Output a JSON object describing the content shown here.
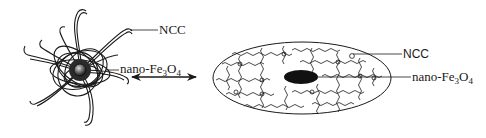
{
  "diagram": {
    "left_structure": {
      "name": "NCC-coated nanoparticle (star/flower form)",
      "labels": {
        "ncc": "NCC",
        "core_prefix": "nano-Fe",
        "core_sub1": "3",
        "core_mid": "O",
        "core_sub2": "4"
      }
    },
    "arrow": {
      "type": "double-headed",
      "meaning": "reversible transformation"
    },
    "right_structure": {
      "name": "NCC network (ellipsoid form) with magnetic core",
      "labels": {
        "ncc": "NCC",
        "core_prefix": "nano-Fe",
        "core_sub1": "3",
        "core_mid": "O",
        "core_sub2": "4"
      }
    },
    "colors": {
      "ink": "#1a1a1a",
      "background": "#ffffff",
      "core": "#111111"
    }
  }
}
